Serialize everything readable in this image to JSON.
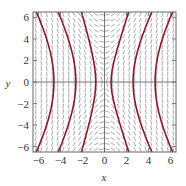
{
  "chart_data": {
    "type": "line",
    "subtype": "direction-field-with-solution-curves",
    "title": "",
    "xlabel": "x",
    "ylabel": "y",
    "xlim": [
      -6.5,
      6.5
    ],
    "ylim": [
      -6.5,
      6.5
    ],
    "xticks": [
      -6,
      -4,
      -2,
      0,
      2,
      4,
      6
    ],
    "yticks": [
      -6,
      -4,
      -2,
      0,
      2,
      4,
      6
    ],
    "xtick_labels": [
      "−6",
      "−4",
      "−2",
      "0",
      "2",
      "4",
      "6"
    ],
    "ytick_labels": [
      "−6",
      "−4",
      "−2",
      "0",
      "2",
      "4",
      "6"
    ],
    "grid": false,
    "legend": null,
    "slope_field": {
      "description": "Short line segments indicating slope; steep everywhere, negative in quadrants II/IV, positive in quadrants I/III",
      "spacing": 0.5,
      "color": "#888888"
    },
    "series": [
      {
        "name": "solution-1",
        "x_at_y0": -4.6,
        "x_at_y_extreme": -6.2
      },
      {
        "name": "solution-2",
        "x_at_y0": -2.6,
        "x_at_y_extreme": -4.2
      },
      {
        "name": "solution-3",
        "x_at_y0": -0.8,
        "x_at_y_extreme": -2.1
      },
      {
        "name": "solution-4",
        "x_at_y0": 0.6,
        "x_at_y_extreme": 2.2
      },
      {
        "name": "solution-5",
        "x_at_y0": 2.6,
        "x_at_y_extreme": 4.3
      },
      {
        "name": "solution-6",
        "x_at_y0": 4.6,
        "x_at_y_extreme": 6.2
      }
    ],
    "curve_color": "#8b1a2b",
    "axis_color": "#555555"
  }
}
